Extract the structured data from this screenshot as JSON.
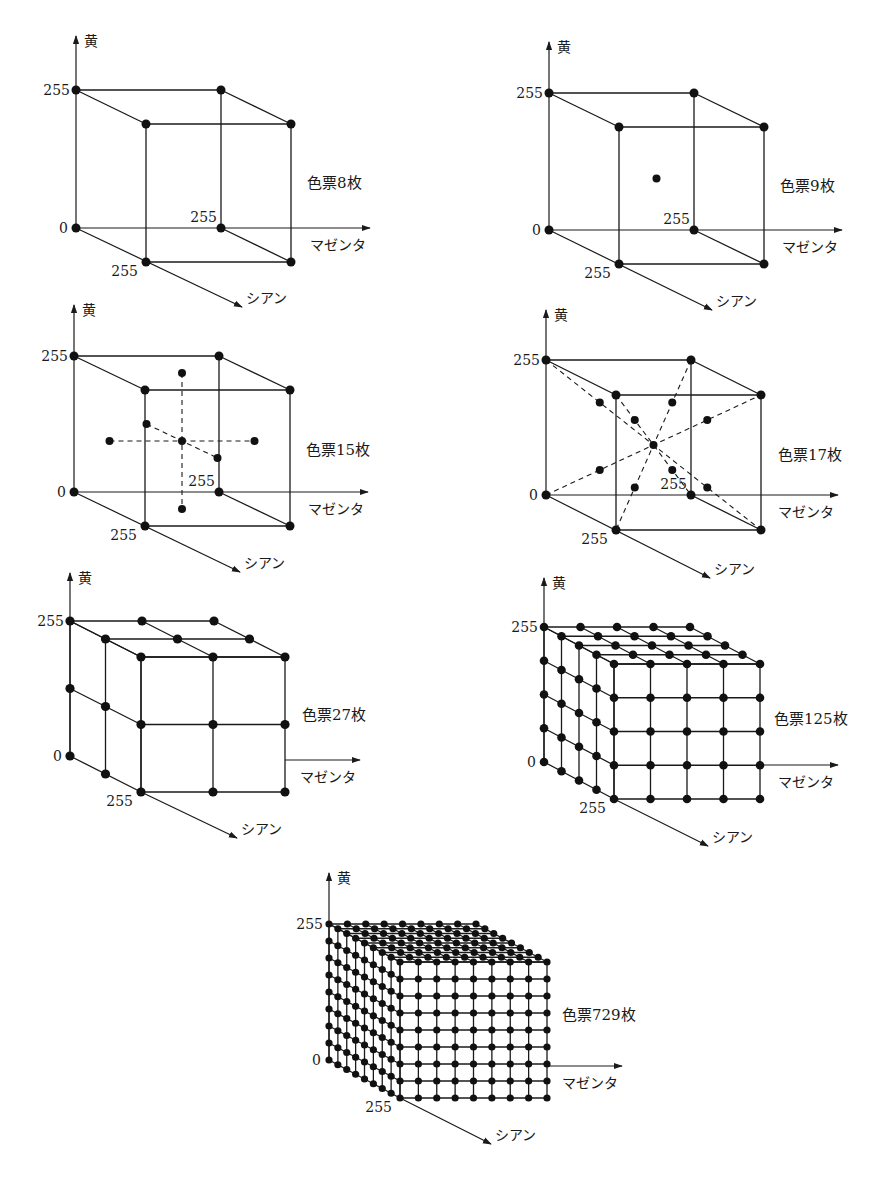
{
  "figure": {
    "axis_labels": {
      "yellow": "黄",
      "magenta": "マゼンタ",
      "cyan": "シアン"
    },
    "tick_labels": {
      "zero": "0",
      "max": "255"
    },
    "colors": {
      "ink": "#1a1a1a",
      "background": "#ffffff"
    }
  },
  "panels": [
    {
      "id": "patches-8",
      "label": "色票8枚",
      "levels": 2,
      "type": "wireframe",
      "extras": "none",
      "origin": [
        76,
        228
      ],
      "w": 145,
      "h": 138,
      "d": [
        70,
        34
      ],
      "yaxis_top": 36,
      "magenta_end": 370,
      "cyan_end": [
        242,
        307
      ],
      "label_pos": [
        307,
        188
      ]
    },
    {
      "id": "patches-9",
      "label": "色票9枚",
      "levels": 2,
      "type": "wireframe",
      "extras": "center",
      "origin": [
        549,
        230
      ],
      "w": 145,
      "h": 137,
      "d": [
        70,
        34
      ],
      "yaxis_top": 42,
      "magenta_end": 842,
      "cyan_end": [
        712,
        310
      ],
      "label_pos": [
        780,
        191
      ]
    },
    {
      "id": "patches-15",
      "label": "色票15枚",
      "levels": 2,
      "type": "wireframe",
      "extras": "axial",
      "origin": [
        74,
        492
      ],
      "w": 145,
      "h": 136,
      "d": [
        71,
        34
      ],
      "yaxis_top": 305,
      "magenta_end": 368,
      "cyan_end": [
        240,
        572
      ],
      "label_pos": [
        306,
        455
      ]
    },
    {
      "id": "patches-17",
      "label": "色票17枚",
      "levels": 2,
      "type": "wireframe",
      "extras": "diagonal",
      "origin": [
        546,
        495
      ],
      "w": 145,
      "h": 135,
      "d": [
        70,
        35
      ],
      "yaxis_top": 310,
      "magenta_end": 838,
      "cyan_end": [
        710,
        578
      ],
      "label_pos": [
        778,
        460
      ]
    },
    {
      "id": "patches-27",
      "label": "色票27枚",
      "levels": 3,
      "type": "solid-grid",
      "extras": "none",
      "origin": [
        70,
        756
      ],
      "w": 144,
      "h": 135,
      "d": [
        71,
        36
      ],
      "yaxis_top": 573,
      "magenta_end": 360,
      "magenta_y": 760,
      "cyan_end": [
        237,
        838
      ],
      "label_pos": [
        302,
        720
      ]
    },
    {
      "id": "patches-125",
      "label": "色票125枚",
      "levels": 5,
      "type": "solid-grid",
      "extras": "none",
      "origin": [
        544,
        762
      ],
      "w": 146,
      "h": 135,
      "d": [
        70,
        37
      ],
      "yaxis_top": 578,
      "magenta_end": 838,
      "magenta_y": 765,
      "cyan_end": [
        708,
        846
      ],
      "label_pos": [
        774,
        724
      ]
    },
    {
      "id": "patches-729",
      "label": "色票729枚",
      "levels": 9,
      "type": "solid-grid",
      "extras": "none",
      "origin": [
        329,
        1060
      ],
      "w": 147,
      "h": 136,
      "d": [
        71,
        38
      ],
      "yaxis_top": 873,
      "magenta_end": 622,
      "magenta_y": 1066,
      "cyan_end": [
        491,
        1144
      ],
      "label_pos": [
        562,
        1020
      ]
    }
  ],
  "chart_data": [
    {
      "type": "scatter",
      "title": "色票8枚",
      "dimensions": [
        "シアン",
        "マゼンタ",
        "黄"
      ],
      "range": [
        0,
        255
      ],
      "levels_per_axis": 2,
      "points": 8,
      "description": "cube corners only"
    },
    {
      "type": "scatter",
      "title": "色票9枚",
      "dimensions": [
        "シアン",
        "マゼンタ",
        "黄"
      ],
      "range": [
        0,
        255
      ],
      "levels_per_axis": 2,
      "points": 9,
      "description": "cube corners + center point"
    },
    {
      "type": "scatter",
      "title": "色票15枚",
      "dimensions": [
        "シアン",
        "マゼンタ",
        "黄"
      ],
      "range": [
        0,
        255
      ],
      "levels_per_axis": 2,
      "points": 15,
      "description": "cube corners + center + 6 points along axial lines through center"
    },
    {
      "type": "scatter",
      "title": "色票17枚",
      "dimensions": [
        "シアン",
        "マゼンタ",
        "黄"
      ],
      "range": [
        0,
        255
      ],
      "levels_per_axis": 2,
      "points": 17,
      "description": "cube corners + center + 8 midpoints along body diagonals"
    },
    {
      "type": "scatter",
      "title": "色票27枚",
      "dimensions": [
        "シアン",
        "マゼンタ",
        "黄"
      ],
      "range": [
        0,
        255
      ],
      "levels_per_axis": 3,
      "points": 27,
      "description": "3x3x3 grid"
    },
    {
      "type": "scatter",
      "title": "色票125枚",
      "dimensions": [
        "シアン",
        "マゼンタ",
        "黄"
      ],
      "range": [
        0,
        255
      ],
      "levels_per_axis": 5,
      "points": 125,
      "description": "5x5x5 grid"
    },
    {
      "type": "scatter",
      "title": "色票729枚",
      "dimensions": [
        "シアン",
        "マゼンタ",
        "黄"
      ],
      "range": [
        0,
        255
      ],
      "levels_per_axis": 9,
      "points": 729,
      "description": "9x9x9 grid"
    }
  ]
}
